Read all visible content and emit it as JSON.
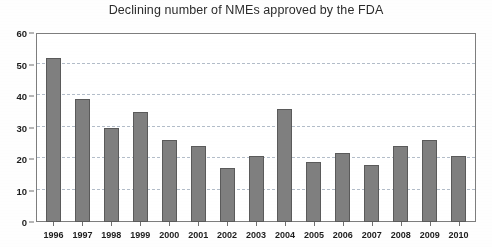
{
  "chart_data": {
    "type": "bar",
    "title": "Declining number of NMEs approved by the FDA",
    "xlabel": "",
    "ylabel": "",
    "categories": [
      "1996",
      "1997",
      "1998",
      "1999",
      "2000",
      "2001",
      "2002",
      "2003",
      "2004",
      "2005",
      "2006",
      "2007",
      "2008",
      "2009",
      "2010"
    ],
    "values": [
      52,
      39,
      30,
      35,
      26,
      24,
      17,
      21,
      36,
      19,
      22,
      18,
      24,
      26,
      21
    ],
    "ylim": [
      0,
      60
    ],
    "ytick_labels": [
      "0",
      "10",
      "20",
      "30",
      "40",
      "50",
      "60"
    ],
    "ytick_values": [
      0,
      10,
      20,
      30,
      40,
      50,
      60
    ],
    "grid": true,
    "grid_axis": "y",
    "grid_style": "dashed",
    "legend": false,
    "legend_position": "none",
    "bar_color": "#7f7f7f",
    "bar_edge_color": "#5a5a5a",
    "grid_color": "#9aa7b8",
    "axis_color": "#7d7d7d",
    "background_color": "#ffffff",
    "title_color": "#2b2b2b"
  }
}
